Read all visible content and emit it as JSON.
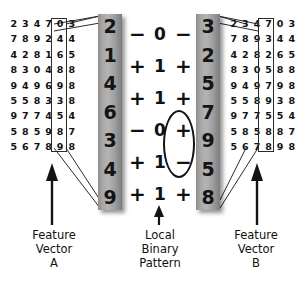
{
  "left_grid": {
    "name": "pixel-neighbourhood-grid-a",
    "rows": [
      [
        "2",
        "3",
        "4",
        "7",
        "0",
        "3",
        ""
      ],
      [
        "7",
        "8",
        "9",
        "2",
        "4",
        "4",
        ""
      ],
      [
        "4",
        "2",
        "8",
        "1",
        "6",
        "5",
        ""
      ],
      [
        "8",
        "3",
        "0",
        "4",
        "8",
        "8",
        ""
      ],
      [
        "9",
        "4",
        "9",
        "6",
        "9",
        "8",
        ""
      ],
      [
        "5",
        "5",
        "8",
        "3",
        "3",
        "8",
        ""
      ],
      [
        "9",
        "7",
        "7",
        "4",
        "5",
        "4",
        ""
      ],
      [
        "5",
        "8",
        "5",
        "9",
        "8",
        "7",
        ""
      ],
      [
        "5",
        "6",
        "7",
        "8",
        "9",
        "8",
        ""
      ]
    ]
  },
  "right_grid": {
    "name": "pixel-neighbourhood-grid-b",
    "rows": [
      [
        "2",
        "3",
        "4",
        "7",
        "0",
        "3",
        ""
      ],
      [
        "7",
        "8",
        "9",
        "3",
        "4",
        "4",
        ""
      ],
      [
        "4",
        "2",
        "8",
        "2",
        "6",
        "5",
        ""
      ],
      [
        "8",
        "3",
        "0",
        "5",
        "8",
        "8",
        ""
      ],
      [
        "9",
        "4",
        "9",
        "7",
        "9",
        "8",
        ""
      ],
      [
        "5",
        "5",
        "8",
        "9",
        "3",
        "8",
        ""
      ],
      [
        "9",
        "7",
        "7",
        "5",
        "5",
        "4",
        ""
      ],
      [
        "5",
        "8",
        "5",
        "8",
        "8",
        "7",
        ""
      ],
      [
        "5",
        "6",
        "7",
        "8",
        "9",
        "8",
        ""
      ]
    ]
  },
  "feature_vector_a": {
    "label": "Feature\nVector\nA",
    "values": [
      "2",
      "1",
      "4",
      "6",
      "3",
      "4",
      "9"
    ]
  },
  "feature_vector_b": {
    "label": "Feature\nVector\nB",
    "values": [
      "3",
      "2",
      "5",
      "7",
      "9",
      "5",
      "8"
    ]
  },
  "local_binary_pattern": {
    "label": "Local\nBinary\nPattern",
    "rows": [
      {
        "left_sign": "−",
        "bit": "0",
        "right_sign": "−"
      },
      {
        "left_sign": "+",
        "bit": "1",
        "right_sign": "+"
      },
      {
        "left_sign": "+",
        "bit": "1",
        "right_sign": "+"
      },
      {
        "left_sign": "−",
        "bit": "0",
        "right_sign": "+"
      },
      {
        "left_sign": "+",
        "bit": "1",
        "right_sign": "−"
      },
      {
        "left_sign": "+",
        "bit": "1",
        "right_sign": "+"
      }
    ],
    "bits": "011011",
    "highlight": "mismatching-sign-pair"
  },
  "colors": {
    "bar_light": "#b4b4b4",
    "bar_dark": "#7c7c7c",
    "ink": "#111111",
    "background": "#ffffff"
  }
}
